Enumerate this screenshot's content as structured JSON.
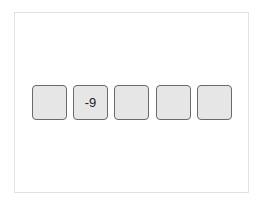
{
  "cells": [
    {
      "value": ""
    },
    {
      "value": "-9"
    },
    {
      "value": ""
    },
    {
      "value": ""
    },
    {
      "value": ""
    }
  ],
  "colors": {
    "cell_bg": "#e6e6e6",
    "cell_border": "#6a6a6a",
    "frame_border": "#e2e2e2"
  }
}
